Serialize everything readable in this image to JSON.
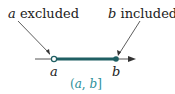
{
  "labels": {
    "a_var": "a",
    "excluded": "excluded",
    "b_var": "b",
    "included": "included",
    "tick_a": "a",
    "tick_b": "b"
  },
  "caption": {
    "open": "(",
    "a": "a",
    "sep": ", ",
    "b": "b",
    "close": "]"
  },
  "colors": {
    "line": "#555555",
    "interval": "#1f5f63",
    "caption": "#2a8f99"
  }
}
